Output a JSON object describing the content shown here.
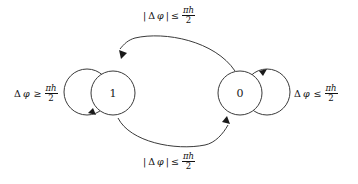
{
  "diagram": {
    "type": "finite-state-machine",
    "background_color": "#ffffff",
    "stroke_color": "#3a3a3a",
    "shadow_color": "#7a7a7a",
    "nodes": [
      {
        "id": "state-1",
        "label": "1",
        "cx": 113,
        "cy": 93,
        "r": 22
      },
      {
        "id": "state-0",
        "label": "0",
        "cx": 240,
        "cy": 93,
        "r": 22
      }
    ],
    "edges": [
      {
        "id": "edge-0-to-1",
        "from": "0",
        "to": "1",
        "position": "top",
        "label": {
          "abs_open": "|",
          "delta": "Δ",
          "phi": "φ",
          "abs_close": "|",
          "relation": "≤",
          "numerator": "πh",
          "denominator": "2"
        },
        "label_text": "|Δφ| ≤ πh/2"
      },
      {
        "id": "edge-1-to-0",
        "from": "1",
        "to": "0",
        "position": "bottom",
        "label": {
          "abs_open": "|",
          "delta": "Δ",
          "phi": "φ",
          "abs_close": "|",
          "relation": "≤",
          "numerator": "πh",
          "denominator": "2"
        },
        "label_text": "|Δφ| ≤ πh/2"
      },
      {
        "id": "self-loop-1",
        "from": "1",
        "to": "1",
        "position": "left",
        "label": {
          "abs_open": "",
          "delta": "Δ",
          "phi": "φ",
          "abs_close": "",
          "relation": "≥",
          "numerator": "πh",
          "denominator": "2"
        },
        "label_text": "Δφ ≥ πh/2"
      },
      {
        "id": "self-loop-0",
        "from": "0",
        "to": "0",
        "position": "right",
        "label": {
          "abs_open": "",
          "delta": "Δ",
          "phi": "φ",
          "abs_close": "",
          "relation": "≤",
          "numerator": "πh",
          "denominator": "2"
        },
        "label_text": "Δφ ≤ πh/2"
      }
    ]
  }
}
